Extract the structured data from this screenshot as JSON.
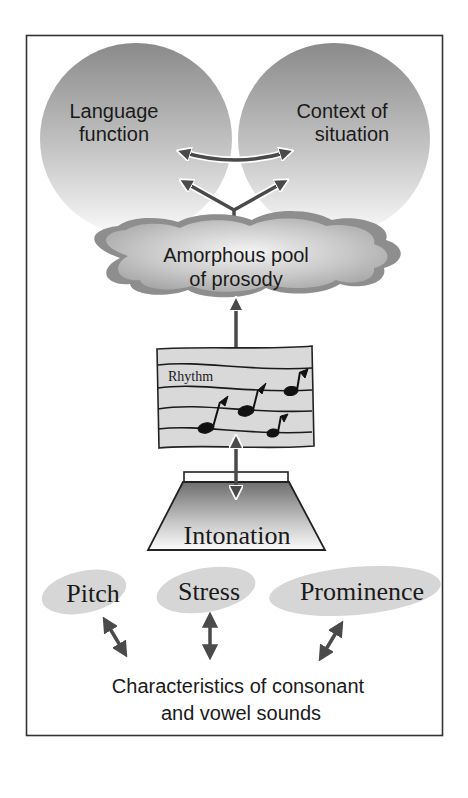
{
  "diagram": {
    "title": "",
    "nodes": {
      "language_function": {
        "line1": "Language",
        "line2": "function"
      },
      "context_of_situation": {
        "line1": "Context of",
        "line2": "situation"
      },
      "amorphous_pool": {
        "line1": "Amorphous pool",
        "line2": "of prosody"
      },
      "rhythm": {
        "label": "Rhythm"
      },
      "intonation": {
        "label": "Intonation"
      },
      "pitch": {
        "label": "Pitch"
      },
      "stress": {
        "label": "Stress"
      },
      "prominence": {
        "label": "Prominence"
      },
      "characteristics": {
        "line1": "Characteristics of consonant",
        "line2": "and vowel sounds"
      }
    },
    "edges": [
      {
        "from": "language_function",
        "to": "context_of_situation",
        "type": "bidirectional"
      },
      {
        "from": "language_function",
        "to": "amorphous_pool",
        "type": "bidirectional"
      },
      {
        "from": "context_of_situation",
        "to": "amorphous_pool",
        "type": "bidirectional"
      },
      {
        "from": "amorphous_pool",
        "to": "rhythm",
        "type": "bidirectional"
      },
      {
        "from": "rhythm",
        "to": "intonation",
        "type": "bidirectional"
      },
      {
        "from": "pitch",
        "to": "characteristics",
        "type": "bidirectional"
      },
      {
        "from": "stress",
        "to": "characteristics",
        "type": "bidirectional"
      },
      {
        "from": "prominence",
        "to": "characteristics",
        "type": "bidirectional"
      }
    ],
    "colors": {
      "arrow": "#4a4a4a",
      "frame": "#333333",
      "shape_dark": "#8c8c8c",
      "shape_light": "#f2f2f2",
      "ellipse": "#d6d6d6",
      "text": "#1a1a1a"
    }
  }
}
